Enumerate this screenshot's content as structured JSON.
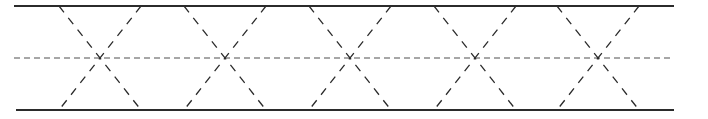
{
  "diagram": {
    "width": 708,
    "height": 119,
    "colors": {
      "boundary": "#2b2b2b",
      "diagonal": "#2b2b2b",
      "centerline": "#8a8a8a",
      "background": "#ffffff"
    },
    "boundaries": {
      "top": {
        "x1": 14,
        "x2": 674,
        "y": 6
      },
      "bottom": {
        "x1": 16,
        "x2": 674,
        "y": 110
      }
    },
    "centerline": {
      "x1": 14,
      "x2": 674,
      "y": 58
    },
    "crossings_x": [
      100,
      225,
      350,
      475,
      598
    ],
    "half_span": 41
  }
}
